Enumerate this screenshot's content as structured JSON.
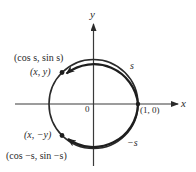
{
  "diagram": {
    "axes": {
      "x_label": "x",
      "y_label": "y",
      "origin_label": "0"
    },
    "points": [
      {
        "id": "p_pos",
        "label_xy": "(x, y)",
        "label_trig": "(cos s, sin s)"
      },
      {
        "id": "p_neg",
        "label_xy": "(x, −y)",
        "label_trig": "(cos −s, sin −s)"
      },
      {
        "id": "p_one",
        "label": "(1, 0)"
      }
    ],
    "arcs": [
      {
        "id": "arc_pos",
        "label": "s",
        "direction": "counterclockwise"
      },
      {
        "id": "arc_neg",
        "label": "−s",
        "direction": "clockwise"
      }
    ],
    "colors": {
      "ink": "#2a2a2a",
      "background": "#ffffff"
    }
  }
}
